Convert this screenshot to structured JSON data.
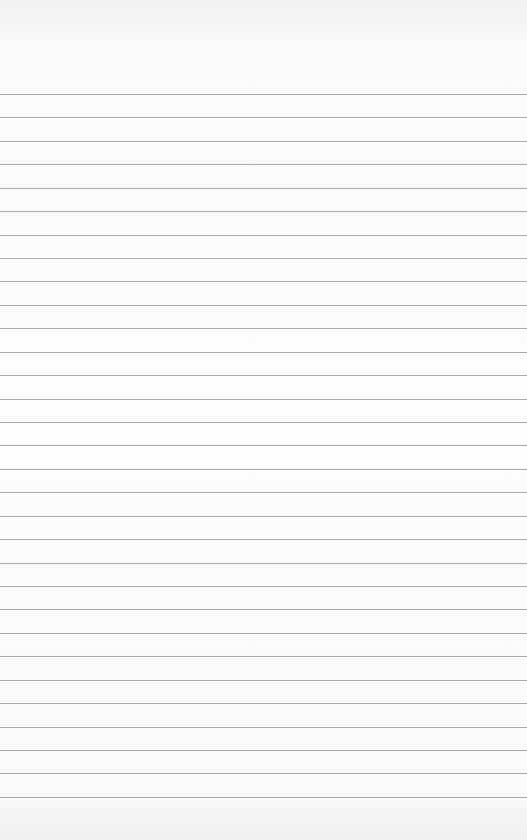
{
  "paper": {
    "type": "ruled notebook page",
    "background_color": "#fcfcfc",
    "line_color": "#9a9a9a",
    "first_line_y": 94,
    "line_spacing": 23.43,
    "line_count": 31,
    "text": ""
  }
}
